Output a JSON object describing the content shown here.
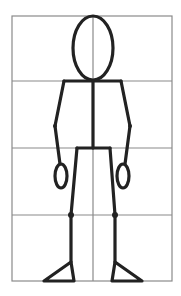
{
  "diagram": {
    "title": "Stick figure body proportions on a grid",
    "colors": {
      "grid": "#8a8a8a",
      "figure": "#222222",
      "background": "#ffffff"
    },
    "grid": {
      "left": 12,
      "right": 172,
      "top": 16,
      "bottom": 281,
      "horizontal_lines": [
        81,
        148,
        215
      ],
      "center_x": 93,
      "rows": 4,
      "row_labels": [
        "head",
        "torso",
        "hips-to-knees",
        "knees-to-feet"
      ]
    },
    "figure": {
      "head": {
        "cx": 93,
        "cy": 48,
        "rx": 20,
        "ry": 32
      },
      "shoulders": {
        "x1": 64,
        "x2": 121,
        "y": 81
      },
      "spine": {
        "x": 93,
        "y1": 81,
        "y2": 148
      },
      "left_arm": "64,81 55,126 60,164",
      "right_arm": "121,81 130,126 125,164",
      "left_elbow": {
        "cx": 55,
        "cy": 126
      },
      "right_elbow": {
        "cx": 130,
        "cy": 126
      },
      "left_hand": {
        "cx": 61,
        "cy": 176,
        "rx": 6,
        "ry": 12
      },
      "right_hand": {
        "cx": 123,
        "cy": 176,
        "rx": 6,
        "ry": 12
      },
      "hips": {
        "x1": 77,
        "x2": 110,
        "y": 148
      },
      "left_leg": "77,148 71,215 71,262",
      "right_leg": "110,148 115,215 115,262",
      "left_knee": {
        "cx": 71,
        "cy": 215
      },
      "right_knee": {
        "cx": 115,
        "cy": 215
      },
      "left_foot": "71,262 74,281 44,281",
      "right_foot": "115,262 112,281 142,281"
    }
  }
}
